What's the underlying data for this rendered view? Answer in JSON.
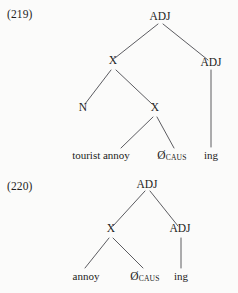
{
  "document": {
    "type": "linguistics-syntax-trees",
    "background_color": "#fbfbfa",
    "text_color": "#1c1c1c",
    "line_color": "#4a4a4f"
  },
  "examples": [
    {
      "number": "(219)",
      "nodes": {
        "root": "ADJ",
        "x_upper": "X",
        "adj_right": "ADJ",
        "n": "N",
        "x_lower": "X"
      },
      "leaves": {
        "tourist_annoy": "tourist annoy",
        "zero": "Ø",
        "zero_subscript": "CAUS",
        "ing": "ing"
      }
    },
    {
      "number": "(220)",
      "nodes": {
        "root": "ADJ",
        "x": "X",
        "adj_right": "ADJ"
      },
      "leaves": {
        "annoy": "annoy",
        "zero": "Ø",
        "zero_subscript": "CAUS",
        "ing": "ing"
      }
    }
  ]
}
